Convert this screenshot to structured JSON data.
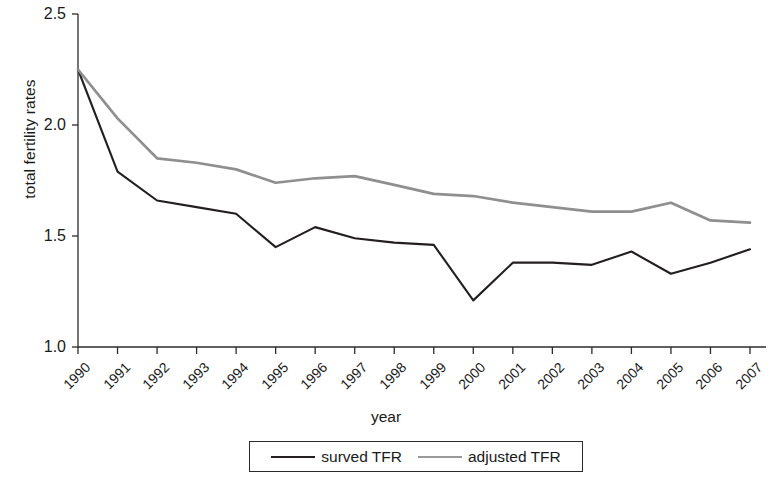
{
  "chart_data": {
    "type": "line",
    "title": "",
    "xlabel": "year",
    "ylabel": "total fertility rates",
    "grid": false,
    "legend_position": "bottom",
    "xlim": [
      1990,
      2007
    ],
    "ylim": [
      1.0,
      2.5
    ],
    "y_ticks": [
      "1.0",
      "1.5",
      "2.0",
      "2.5"
    ],
    "y_tick_values": [
      1.0,
      1.5,
      2.0,
      2.5
    ],
    "categories": [
      "1990",
      "1991",
      "1992",
      "1993",
      "1994",
      "1995",
      "1996",
      "1997",
      "1998",
      "1999",
      "2000",
      "2001",
      "2002",
      "2003",
      "2004",
      "2005",
      "2006",
      "2007"
    ],
    "series": [
      {
        "name": "surved TFR",
        "color": "#231f20",
        "values": [
          2.25,
          1.79,
          1.66,
          1.63,
          1.6,
          1.45,
          1.54,
          1.49,
          1.47,
          1.46,
          1.21,
          1.38,
          1.38,
          1.37,
          1.43,
          1.33,
          1.38,
          1.44
        ]
      },
      {
        "name": "adjusted TFR",
        "color": "#8f8f8f",
        "values": [
          2.25,
          2.03,
          1.85,
          1.83,
          1.8,
          1.74,
          1.76,
          1.77,
          1.73,
          1.69,
          1.68,
          1.65,
          1.63,
          1.61,
          1.61,
          1.65,
          1.57,
          1.56
        ]
      }
    ]
  },
  "axes": {
    "y_title": "total fertility rates",
    "x_title": "year"
  },
  "legend": {
    "entries": [
      {
        "label": "surved TFR",
        "color": "#231f20",
        "thickness": "2.1px"
      },
      {
        "label": "adjusted TFR",
        "color": "#9a9a9a",
        "thickness": "2.6px"
      }
    ]
  }
}
